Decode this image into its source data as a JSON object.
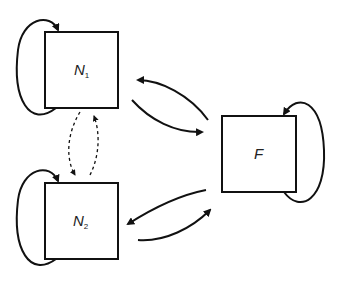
{
  "diagram": {
    "nodes": [
      {
        "id": "N1",
        "label": "N",
        "subscript": "1"
      },
      {
        "id": "N2",
        "label": "N",
        "subscript": "2"
      },
      {
        "id": "F",
        "label": "F",
        "subscript": ""
      }
    ],
    "edges": [
      {
        "from": "N1",
        "to": "N1",
        "style": "solid",
        "type": "self-loop"
      },
      {
        "from": "N2",
        "to": "N2",
        "style": "solid",
        "type": "self-loop"
      },
      {
        "from": "F",
        "to": "F",
        "style": "solid",
        "type": "self-loop"
      },
      {
        "from": "N1",
        "to": "F",
        "style": "solid"
      },
      {
        "from": "F",
        "to": "N1",
        "style": "solid"
      },
      {
        "from": "N2",
        "to": "F",
        "style": "solid"
      },
      {
        "from": "F",
        "to": "N2",
        "style": "solid"
      },
      {
        "from": "N1",
        "to": "N2",
        "style": "dashed"
      },
      {
        "from": "N2",
        "to": "N1",
        "style": "dashed"
      }
    ]
  }
}
